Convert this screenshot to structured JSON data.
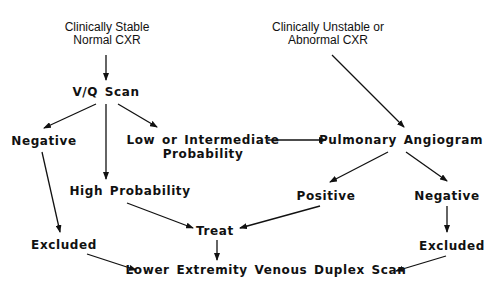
{
  "diagram": {
    "type": "flowchart",
    "colors": {
      "line": "#111111",
      "text": "#111111",
      "background": "#ffffff"
    },
    "nodes": {
      "stable": {
        "line1": "Clinically Stable",
        "line2": "Normal CXR"
      },
      "unstable": {
        "line1": "Clinically Unstable or",
        "line2": "Abnormal CXR"
      },
      "vq_scan": {
        "label": "V/Q Scan"
      },
      "vq_negative": {
        "label": "Negative"
      },
      "low_intermediate": {
        "line1": "Low or Intermediate",
        "line2": "Probability"
      },
      "pulmonary_angiogram": {
        "label": "Pulmonary Angiogram"
      },
      "high_probability": {
        "label": "High Probability"
      },
      "angio_positive": {
        "label": "Positive"
      },
      "angio_negative": {
        "label": "Negative"
      },
      "treat": {
        "label": "Treat"
      },
      "excluded_left": {
        "label": "Excluded"
      },
      "excluded_right": {
        "label": "Excluded"
      },
      "duplex_scan": {
        "label": "Lower Extremity Venous Duplex Scan"
      }
    },
    "edges": [
      {
        "from": "stable",
        "to": "vq_scan"
      },
      {
        "from": "vq_scan",
        "to": "vq_negative"
      },
      {
        "from": "vq_scan",
        "to": "high_probability"
      },
      {
        "from": "vq_scan",
        "to": "low_intermediate"
      },
      {
        "from": "unstable",
        "to": "pulmonary_angiogram"
      },
      {
        "from": "low_intermediate",
        "to": "pulmonary_angiogram"
      },
      {
        "from": "pulmonary_angiogram",
        "to": "angio_positive"
      },
      {
        "from": "pulmonary_angiogram",
        "to": "angio_negative"
      },
      {
        "from": "vq_negative",
        "to": "excluded_left"
      },
      {
        "from": "high_probability",
        "to": "treat"
      },
      {
        "from": "angio_positive",
        "to": "treat"
      },
      {
        "from": "angio_negative",
        "to": "excluded_right"
      },
      {
        "from": "treat",
        "to": "duplex_scan"
      },
      {
        "from": "excluded_left",
        "to": "duplex_scan"
      },
      {
        "from": "excluded_right",
        "to": "duplex_scan"
      }
    ]
  }
}
